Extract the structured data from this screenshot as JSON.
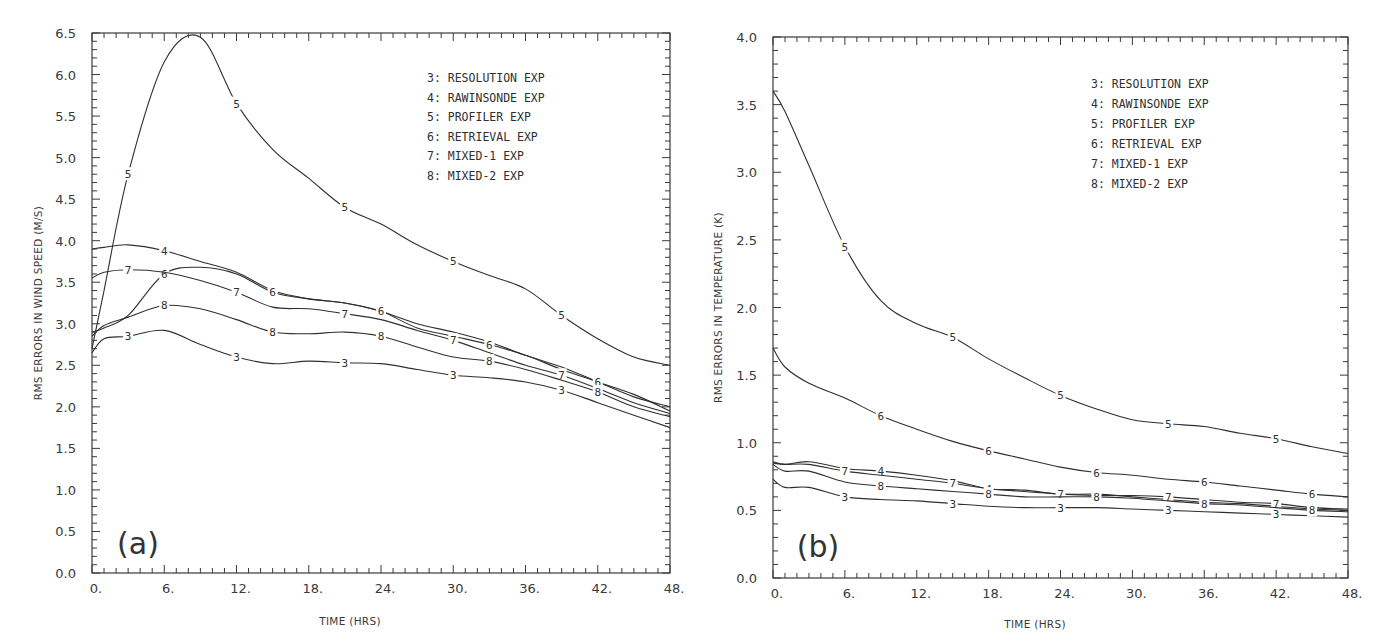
{
  "chart_data": [
    {
      "type": "line",
      "panel_label": "(a)",
      "title": "",
      "xlabel": "TIME (HRS)",
      "ylabel": "RMS ERRORS IN WIND SPEED (M/S)",
      "xlim": [
        0,
        48
      ],
      "ylim": [
        0,
        6.5
      ],
      "xticks": [
        "0.",
        "6.",
        "12.",
        "18.",
        "24.",
        "30.",
        "36.",
        "42.",
        "48."
      ],
      "yticks": [
        "0.0",
        "0.5",
        "1.0",
        "1.5",
        "2.0",
        "2.5",
        "3.0",
        "3.5",
        "4.0",
        "4.5",
        "5.0",
        "5.5",
        "6.0",
        "6.5"
      ],
      "grid": false,
      "legend_position": "upper right",
      "legend": [
        "3: RESOLUTION EXP",
        "4: RAWINSONDE EXP",
        "5: PROFILER EXP",
        "6: RETRIEVAL EXP",
        "7: MIXED-1 EXP",
        "8: MIXED-2 EXP"
      ],
      "x": [
        0,
        1,
        3,
        6,
        9,
        12,
        15,
        18,
        21,
        24,
        27,
        30,
        33,
        36,
        39,
        42,
        45,
        48
      ],
      "series": [
        {
          "name": "3",
          "label": "RESOLUTION EXP",
          "values": [
            2.65,
            2.82,
            2.85,
            2.92,
            2.75,
            2.6,
            2.52,
            2.55,
            2.53,
            2.52,
            2.45,
            2.38,
            2.35,
            2.3,
            2.2,
            2.05,
            1.9,
            1.75
          ]
        },
        {
          "name": "4",
          "label": "RAWINSONDE EXP",
          "values": [
            3.9,
            3.92,
            3.95,
            3.88,
            3.75,
            3.62,
            3.4,
            3.3,
            3.25,
            3.15,
            3.0,
            2.9,
            2.78,
            2.62,
            2.48,
            2.3,
            2.12,
            2.0
          ]
        },
        {
          "name": "5",
          "label": "PROFILER EXP",
          "values": [
            2.7,
            3.4,
            4.8,
            6.15,
            6.45,
            5.65,
            5.1,
            4.75,
            4.4,
            4.2,
            3.95,
            3.75,
            3.58,
            3.42,
            3.1,
            2.82,
            2.6,
            2.5
          ]
        },
        {
          "name": "6",
          "label": "RETRIEVAL EXP",
          "values": [
            2.9,
            2.95,
            3.1,
            3.6,
            3.68,
            3.6,
            3.38,
            3.3,
            3.25,
            3.15,
            2.95,
            2.85,
            2.75,
            2.62,
            2.45,
            2.3,
            2.15,
            1.95
          ]
        },
        {
          "name": "7",
          "label": "MIXED-1 EXP",
          "values": [
            3.55,
            3.62,
            3.65,
            3.62,
            3.52,
            3.38,
            3.2,
            3.18,
            3.12,
            3.05,
            2.92,
            2.8,
            2.65,
            2.5,
            2.38,
            2.22,
            2.05,
            1.92
          ]
        },
        {
          "name": "8",
          "label": "MIXED-2 EXP",
          "values": [
            2.85,
            2.98,
            3.08,
            3.22,
            3.18,
            3.05,
            2.9,
            2.88,
            2.9,
            2.85,
            2.72,
            2.6,
            2.55,
            2.45,
            2.32,
            2.18,
            2.0,
            1.88
          ]
        }
      ]
    },
    {
      "type": "line",
      "panel_label": "(b)",
      "title": "",
      "xlabel": "TIME (HRS)",
      "ylabel": "RMS ERRORS IN TEMPERATURE (K)",
      "xlim": [
        0,
        48
      ],
      "ylim": [
        0,
        4.0
      ],
      "xticks": [
        "0.",
        "6.",
        "12.",
        "18.",
        "24.",
        "30.",
        "36.",
        "42.",
        "48."
      ],
      "yticks": [
        "0.0",
        "0.5",
        "1.0",
        "1.5",
        "2.0",
        "2.5",
        "3.0",
        "3.5",
        "4.0"
      ],
      "grid": false,
      "legend_position": "upper right",
      "legend": [
        "3: RESOLUTION EXP",
        "4: RAWINSONDE EXP",
        "5: PROFILER EXP",
        "6: RETRIEVAL EXP",
        "7: MIXED-1 EXP",
        "8: MIXED-2 EXP"
      ],
      "x": [
        0,
        1,
        3,
        6,
        9,
        12,
        15,
        18,
        21,
        24,
        27,
        30,
        33,
        36,
        39,
        42,
        45,
        48
      ],
      "series": [
        {
          "name": "3",
          "label": "RESOLUTION EXP",
          "values": [
            0.73,
            0.67,
            0.67,
            0.6,
            0.58,
            0.57,
            0.55,
            0.53,
            0.52,
            0.52,
            0.52,
            0.51,
            0.5,
            0.49,
            0.48,
            0.47,
            0.46,
            0.45
          ]
        },
        {
          "name": "4",
          "label": "RAWINSONDE EXP",
          "values": [
            0.86,
            0.84,
            0.86,
            0.81,
            0.79,
            0.76,
            0.72,
            0.66,
            0.65,
            0.62,
            0.62,
            0.6,
            0.58,
            0.56,
            0.55,
            0.53,
            0.51,
            0.5
          ]
        },
        {
          "name": "5",
          "label": "PROFILER EXP",
          "values": [
            3.6,
            3.45,
            3.05,
            2.45,
            2.05,
            1.88,
            1.78,
            1.62,
            1.48,
            1.35,
            1.25,
            1.17,
            1.14,
            1.12,
            1.07,
            1.03,
            0.97,
            0.92
          ]
        },
        {
          "name": "6",
          "label": "RETRIEVAL EXP",
          "values": [
            1.7,
            1.56,
            1.44,
            1.33,
            1.2,
            1.1,
            1.01,
            0.94,
            0.88,
            0.82,
            0.78,
            0.76,
            0.73,
            0.71,
            0.68,
            0.65,
            0.62,
            0.6
          ]
        },
        {
          "name": "7",
          "label": "MIXED-1 EXP",
          "values": [
            0.85,
            0.84,
            0.84,
            0.79,
            0.76,
            0.73,
            0.7,
            0.66,
            0.64,
            0.62,
            0.61,
            0.61,
            0.6,
            0.58,
            0.56,
            0.55,
            0.52,
            0.51
          ]
        },
        {
          "name": "8",
          "label": "MIXED-2 EXP",
          "values": [
            0.84,
            0.79,
            0.79,
            0.71,
            0.68,
            0.66,
            0.64,
            0.62,
            0.6,
            0.6,
            0.6,
            0.59,
            0.57,
            0.55,
            0.54,
            0.52,
            0.5,
            0.49
          ]
        }
      ]
    }
  ]
}
